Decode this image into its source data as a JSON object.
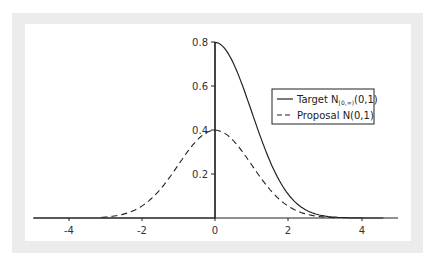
{
  "chart_data": {
    "type": "line",
    "title": "",
    "xlabel": "",
    "ylabel": "",
    "xlim": [
      -5,
      5
    ],
    "ylim": [
      0,
      0.8
    ],
    "grid": false,
    "legend_position": "upper right",
    "x_ticks": [
      -4,
      -2,
      0,
      2,
      4
    ],
    "x_tick_labels": [
      "-4",
      "-2",
      "0",
      "2",
      "4"
    ],
    "y_ticks": [
      0.2,
      0.4,
      0.6,
      0.8
    ],
    "y_tick_labels": [
      "0.2",
      "0.4",
      "0.6",
      "0.8"
    ],
    "series": [
      {
        "name": "Target N[0,∞)(0,1)",
        "style": "solid",
        "description": "Half-normal density 2·φ(x) for x≥0, 0 for x<0",
        "x": [
          0,
          0.5,
          1,
          1.5,
          2,
          2.5,
          3,
          3.5,
          4
        ],
        "values": [
          0.798,
          0.704,
          0.484,
          0.259,
          0.108,
          0.035,
          0.009,
          0.002,
          0.0
        ]
      },
      {
        "name": "Proposal N(0,1)",
        "style": "dashed",
        "description": "Standard normal density φ(x)",
        "x": [
          -4,
          -3,
          -2,
          -1,
          0,
          1,
          2,
          3,
          4
        ],
        "values": [
          0.0,
          0.004,
          0.054,
          0.242,
          0.399,
          0.242,
          0.054,
          0.004,
          0.0
        ]
      }
    ]
  },
  "legend": {
    "target_label": "Target N",
    "target_subscript": "[0,∞)",
    "target_suffix": "(0,1)",
    "proposal_label": "Proposal N(0,1)"
  },
  "axes": {
    "x_labels": [
      "-4",
      "-2",
      "0",
      "2",
      "4"
    ],
    "y_labels": [
      "0.2",
      "0.4",
      "0.6",
      "0.8"
    ]
  }
}
